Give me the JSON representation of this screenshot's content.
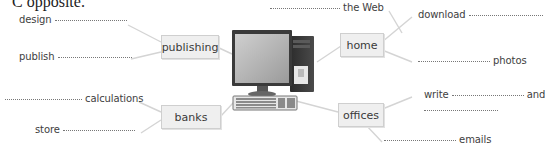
{
  "heading": "C opposite.",
  "center_image": "desktop-computer-icon",
  "hubs": [
    {
      "id": "publishing",
      "label": "publishing"
    },
    {
      "id": "home",
      "label": "home"
    },
    {
      "id": "banks",
      "label": "banks"
    },
    {
      "id": "offices",
      "label": "offices"
    }
  ],
  "phrases": {
    "publishing": [
      {
        "before": "design",
        "after": ""
      },
      {
        "before": "publish",
        "after": ""
      }
    ],
    "home": [
      {
        "before": "",
        "after": "the Web"
      },
      {
        "before": "download",
        "after": ""
      },
      {
        "before": "",
        "after": "photos"
      }
    ],
    "banks": [
      {
        "before": "",
        "after": "calculations"
      },
      {
        "before": "store",
        "after": ""
      }
    ],
    "offices": [
      {
        "before": "write",
        "after": "and",
        "line2": ""
      },
      {
        "before": "",
        "after": "emails"
      }
    ]
  },
  "colors": {
    "box_bg": "#efefef",
    "box_border": "#cfcfcf",
    "connector": "#d4d4d4",
    "text": "#3e3e3e"
  }
}
